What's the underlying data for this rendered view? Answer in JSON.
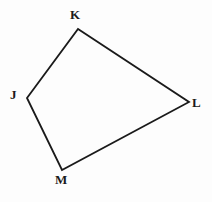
{
  "figure": {
    "kind": "geometry-diagram",
    "shape_name": "quadrilateral JKLM",
    "canvas": {
      "width": 212,
      "height": 202
    },
    "background_color": "#fdfdfd",
    "stroke_color": "#1a1a1a",
    "stroke_width": 1.8,
    "fill_color": "none",
    "label_color": "#1a1a1a",
    "vertices": [
      {
        "id": "J",
        "label": "J",
        "x": 27,
        "y": 98,
        "label_x": 15,
        "label_y": 94
      },
      {
        "id": "K",
        "label": "K",
        "x": 78,
        "y": 29,
        "label_x": 75,
        "label_y": 15
      },
      {
        "id": "L",
        "label": "L",
        "x": 189,
        "y": 102,
        "label_x": 197,
        "label_y": 103
      },
      {
        "id": "M",
        "label": "M",
        "x": 62,
        "y": 170,
        "label_x": 63,
        "label_y": 180
      }
    ],
    "edges": [
      {
        "id": "JK",
        "from": "J",
        "to": "K"
      },
      {
        "id": "KL",
        "from": "K",
        "to": "L"
      },
      {
        "id": "LM",
        "from": "L",
        "to": "M"
      },
      {
        "id": "MJ",
        "from": "M",
        "to": "J"
      }
    ],
    "path_d": "M 27 98 L 78 29 L 189 102 L 62 170 Z"
  }
}
